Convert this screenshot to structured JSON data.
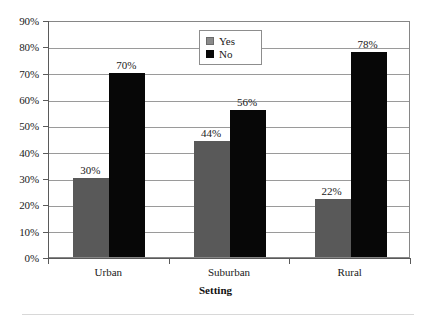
{
  "chart_data": {
    "type": "bar",
    "title": "",
    "subtitle": "",
    "xlabel": "Setting",
    "ylabel": "",
    "categories": [
      "Urban",
      "Suburban",
      "Rural"
    ],
    "series": [
      {
        "name": "Yes",
        "color": "#595959",
        "values": [
          30,
          44,
          22
        ],
        "labels": [
          "30%",
          "44%",
          "22%"
        ]
      },
      {
        "name": "No",
        "color": "#070707",
        "values": [
          70,
          56,
          78
        ],
        "labels": [
          "70%",
          "56%",
          "78%"
        ]
      }
    ],
    "ylim": [
      0,
      90
    ],
    "ytick_step": 10,
    "ytick_labels": [
      "90%",
      "80%",
      "70%",
      "60%",
      "50%",
      "40%",
      "30%",
      "20%",
      "10%",
      "0%"
    ],
    "ytick_values": [
      90,
      80,
      70,
      60,
      50,
      40,
      30,
      20,
      10,
      0
    ],
    "grid": "horizontal",
    "legend_position": "top-center",
    "value_labels_shown": true
  },
  "legend": {
    "entries": [
      {
        "label": "Yes",
        "swatch": "legend-swatch-yes"
      },
      {
        "label": "No",
        "swatch": "legend-swatch-no"
      }
    ]
  },
  "axis": {
    "x_title": "Setting"
  },
  "colors": {
    "series_yes": "#595959",
    "series_no": "#070707",
    "gridline": "#9a9a9a",
    "axis": "#5a5a5a",
    "plot_border": "#868686",
    "background": "#ffffff"
  }
}
